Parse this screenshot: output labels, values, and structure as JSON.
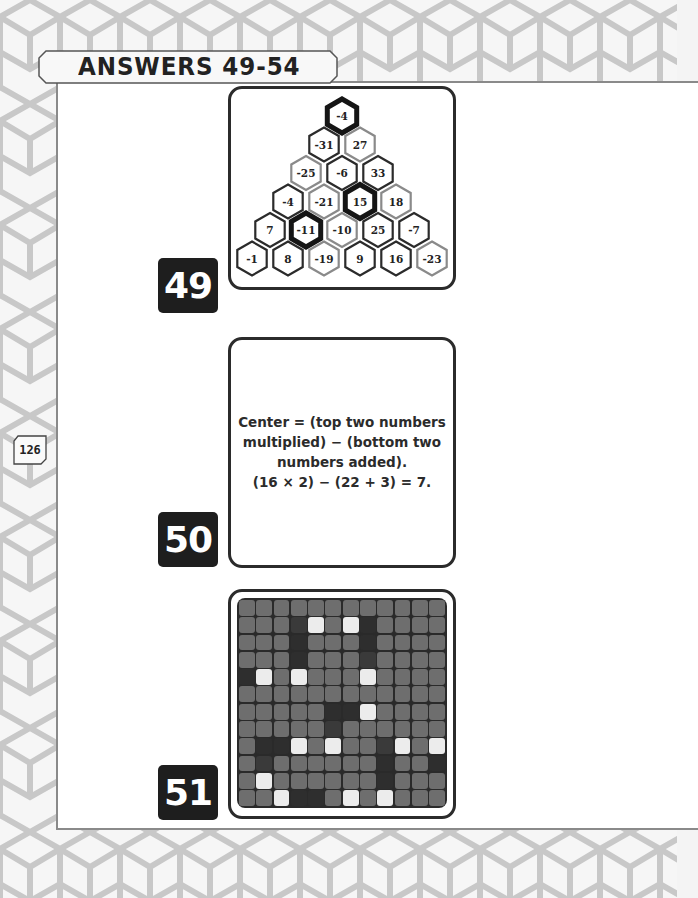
{
  "page": {
    "section_title": "ANSWERS 49-54",
    "page_number": "126"
  },
  "answers": [
    {
      "number": "49",
      "type": "hex-pyramid",
      "rows": [
        [
          {
            "value": "-4",
            "outline": "thick"
          }
        ],
        [
          {
            "value": "-31",
            "outline": "dark"
          },
          {
            "value": "27",
            "outline": "gray"
          }
        ],
        [
          {
            "value": "-25",
            "outline": "gray"
          },
          {
            "value": "-6",
            "outline": "dark"
          },
          {
            "value": "33",
            "outline": "dark"
          }
        ],
        [
          {
            "value": "-4",
            "outline": "dark"
          },
          {
            "value": "-21",
            "outline": "gray"
          },
          {
            "value": "15",
            "outline": "thick"
          },
          {
            "value": "18",
            "outline": "gray"
          }
        ],
        [
          {
            "value": "7",
            "outline": "dark"
          },
          {
            "value": "-11",
            "outline": "thick"
          },
          {
            "value": "-10",
            "outline": "gray"
          },
          {
            "value": "25",
            "outline": "dark"
          },
          {
            "value": "-7",
            "outline": "dark"
          }
        ],
        [
          {
            "value": "-1",
            "outline": "dark"
          },
          {
            "value": "8",
            "outline": "dark"
          },
          {
            "value": "-19",
            "outline": "gray"
          },
          {
            "value": "9",
            "outline": "dark"
          },
          {
            "value": "16",
            "outline": "dark"
          },
          {
            "value": "-23",
            "outline": "gray"
          }
        ]
      ]
    },
    {
      "number": "50",
      "type": "text",
      "lines": [
        "Center = (top two numbers",
        "multiplied) − (bottom two",
        "numbers added).",
        "(16 × 2) − (22 + 3) = 7."
      ]
    },
    {
      "number": "51",
      "type": "grid",
      "size": 12,
      "legend": {
        "m": "mid-gray",
        "d": "dark-gray",
        "dd": "darkest",
        "w": "white"
      },
      "cells": [
        [
          "m",
          "m",
          "m",
          "m",
          "m",
          "m",
          "m",
          "m",
          "m",
          "m",
          "m",
          "m"
        ],
        [
          "m",
          "m",
          "m",
          "d",
          "w",
          "m",
          "w",
          "dd",
          "m",
          "m",
          "m",
          "m"
        ],
        [
          "m",
          "m",
          "m",
          "dd",
          "m",
          "m",
          "m",
          "dd",
          "m",
          "m",
          "m",
          "m"
        ],
        [
          "m",
          "m",
          "m",
          "dd",
          "m",
          "m",
          "m",
          "d",
          "m",
          "m",
          "m",
          "m"
        ],
        [
          "dd",
          "w",
          "m",
          "w",
          "m",
          "m",
          "m",
          "w",
          "m",
          "m",
          "m",
          "m"
        ],
        [
          "m",
          "m",
          "m",
          "m",
          "m",
          "m",
          "m",
          "m",
          "m",
          "m",
          "m",
          "m"
        ],
        [
          "m",
          "m",
          "m",
          "m",
          "m",
          "dd",
          "dd",
          "w",
          "m",
          "m",
          "m",
          "m"
        ],
        [
          "m",
          "m",
          "m",
          "m",
          "m",
          "d",
          "m",
          "m",
          "m",
          "m",
          "m",
          "m"
        ],
        [
          "m",
          "dd",
          "dd",
          "w",
          "m",
          "w",
          "m",
          "m",
          "d",
          "w",
          "m",
          "w"
        ],
        [
          "m",
          "d",
          "m",
          "m",
          "m",
          "m",
          "m",
          "m",
          "dd",
          "m",
          "m",
          "dd"
        ],
        [
          "m",
          "w",
          "m",
          "m",
          "m",
          "m",
          "m",
          "m",
          "dd",
          "m",
          "m",
          "m"
        ],
        [
          "m",
          "m",
          "w",
          "dd",
          "dd",
          "m",
          "w",
          "m",
          "w",
          "m",
          "m",
          "m"
        ]
      ]
    }
  ],
  "colors": {
    "cell_mid": "#6e6e6e",
    "cell_dark": "#3a3a3a",
    "cell_darkest": "#2e2e2e",
    "cell_white": "#ececec",
    "badge_bg": "#1e1e1e",
    "outline_dark": "#2b2b2b",
    "outline_gray": "#8a8a8a"
  }
}
